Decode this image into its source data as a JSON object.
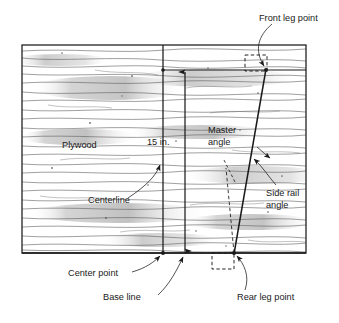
{
  "figure": {
    "type": "technical-diagram"
  },
  "board": {
    "material_label": "Plywood",
    "x": 22,
    "y": 45,
    "width": 284,
    "height": 208,
    "border_color": "#1a1a1a",
    "grain_color": "#5a5a5a"
  },
  "labels": {
    "front_leg_point": "Front leg point",
    "master_angle_line1": "Master",
    "master_angle_line2": "angle",
    "side_rail_angle_line1": "Side rail",
    "side_rail_angle_line2": "angle",
    "plywood": "Plywood",
    "centerline": "Centerline",
    "dimension": "15 in.",
    "center_point": "Center point",
    "base_line": "Base line",
    "rear_leg_point": "Rear leg point"
  },
  "geometry": {
    "centerline_x": 163,
    "dimension_line_x": 185,
    "top_reference_y": 70,
    "base_line_y": 253,
    "side_rail_top_x": 266,
    "side_rail_bottom_x": 234,
    "front_leg_point": {
      "x": 266,
      "y": 70
    },
    "rear_leg_point": {
      "x": 234,
      "y": 253
    },
    "center_point": {
      "x": 163,
      "y": 253
    }
  },
  "colors": {
    "ink": "#1a1a1a",
    "grain": "#5a5a5a",
    "paper": "#ffffff"
  }
}
